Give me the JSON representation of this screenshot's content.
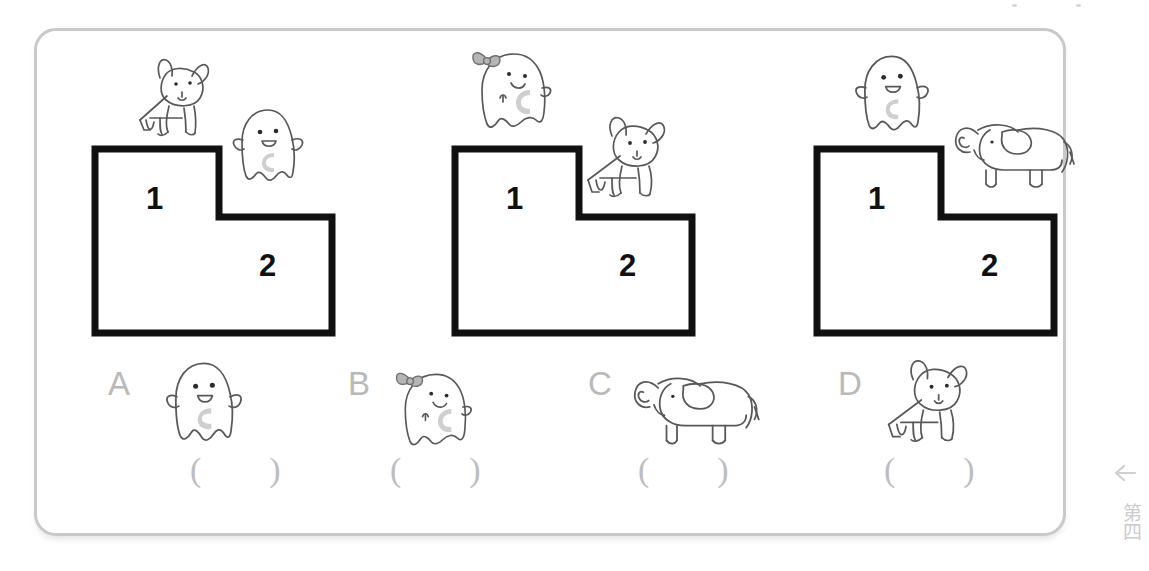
{
  "worksheet": {
    "card_border_color": "#c9c9c9",
    "background_color": "#ffffff",
    "ink_color": "#2b2b2b",
    "gray_text_color": "#b9b9b9"
  },
  "step_labels": {
    "step_one": "1",
    "step_two": "2"
  },
  "groups": [
    {
      "name": "group-one",
      "step_one_label": "1",
      "step_two_label": "2",
      "top_figure": "dog",
      "side_figure": "ghost"
    },
    {
      "name": "group-two",
      "step_one_label": "1",
      "step_two_label": "2",
      "top_figure": "ghost-with-bow",
      "side_figure": "dog"
    },
    {
      "name": "group-three",
      "step_one_label": "1",
      "step_two_label": "2",
      "top_figure": "ghost",
      "side_figure": "elephant"
    }
  ],
  "options": [
    {
      "letter": "A",
      "figure": "ghost",
      "answer_box": "(        )"
    },
    {
      "letter": "B",
      "figure": "ghost-with-bow",
      "answer_box": "(        )"
    },
    {
      "letter": "C",
      "figure": "elephant",
      "answer_box": "(        )"
    },
    {
      "letter": "D",
      "figure": "dog",
      "answer_box": "(        )"
    }
  ],
  "margin_note": {
    "arrow": "left-arrow",
    "characters": "第四"
  }
}
